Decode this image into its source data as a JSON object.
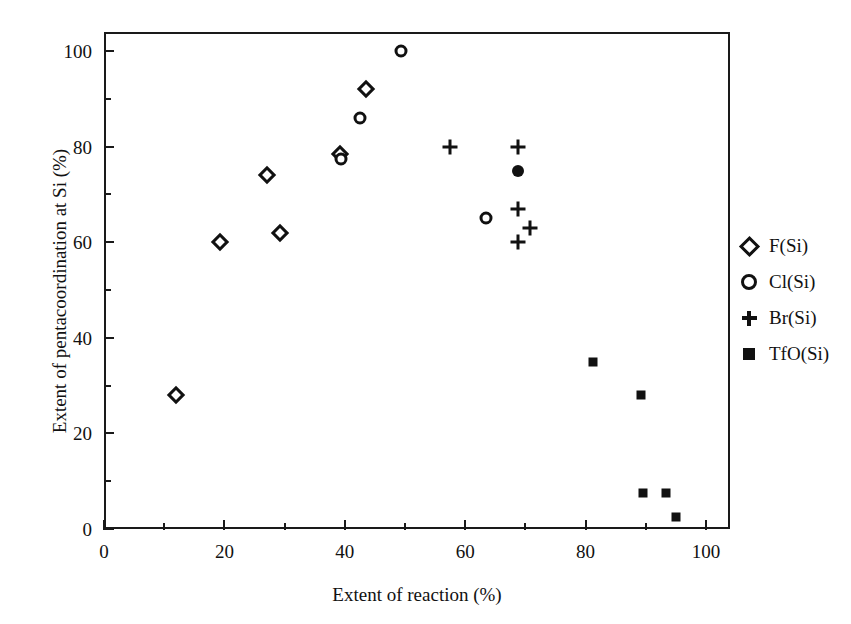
{
  "chart_data": {
    "type": "scatter",
    "title": "",
    "xlabel": "Extent of reaction (%)",
    "ylabel": "Extent of pentacoordination at Si (%)",
    "xlim": [
      0,
      104
    ],
    "ylim": [
      0,
      104
    ],
    "xticks": [
      0,
      20,
      40,
      60,
      80,
      100
    ],
    "xticklabels": [
      "0",
      "20",
      "40",
      "60",
      "80",
      "100"
    ],
    "xminorticks": [
      10,
      30,
      50,
      70,
      90
    ],
    "yticks": [
      0,
      20,
      40,
      60,
      80,
      100
    ],
    "yticklabels": [
      "0",
      "20",
      "40",
      "60",
      "80",
      "100"
    ],
    "yminorticks": [
      10,
      30,
      50,
      70,
      90
    ],
    "grid": false,
    "legend_position": "outside-right",
    "series": [
      {
        "name": "F(Si)",
        "marker": "diamond-open",
        "points": [
          {
            "x": 12.0,
            "y": 28.0
          },
          {
            "x": 19.3,
            "y": 60.0
          },
          {
            "x": 27.0,
            "y": 74.0
          },
          {
            "x": 29.3,
            "y": 62.0
          },
          {
            "x": 39.2,
            "y": 78.5
          },
          {
            "x": 43.5,
            "y": 92.0
          }
        ]
      },
      {
        "name": "Cl(Si)",
        "marker": "circle-open",
        "points": [
          {
            "x": 39.3,
            "y": 77.5
          },
          {
            "x": 42.6,
            "y": 86.0
          },
          {
            "x": 49.4,
            "y": 100.0
          },
          {
            "x": 63.5,
            "y": 65.0
          }
        ]
      },
      {
        "name": "Br(Si)",
        "marker": "plus",
        "points": [
          {
            "x": 57.5,
            "y": 80.0
          },
          {
            "x": 68.8,
            "y": 80.0
          },
          {
            "x": 68.8,
            "y": 67.0
          },
          {
            "x": 70.8,
            "y": 63.0
          },
          {
            "x": 68.8,
            "y": 60.0
          }
        ]
      },
      {
        "name": "TfO(Si)",
        "marker": "square-filled",
        "points": [
          {
            "x": 81.2,
            "y": 35.0
          },
          {
            "x": 89.2,
            "y": 28.0
          },
          {
            "x": 89.5,
            "y": 7.5
          },
          {
            "x": 93.3,
            "y": 7.5
          },
          {
            "x": 95.0,
            "y": 2.5
          }
        ]
      },
      {
        "name": "unlabeled-filled-circle",
        "marker": "circle-filled",
        "points": [
          {
            "x": 68.8,
            "y": 75.0
          }
        ]
      }
    ],
    "legend": [
      {
        "label": "F(Si)",
        "marker": "diamond-open"
      },
      {
        "label": "Cl(Si)",
        "marker": "circle-open"
      },
      {
        "label": "Br(Si)",
        "marker": "plus"
      },
      {
        "label": "TfO(Si)",
        "marker": "square-filled"
      }
    ],
    "colors": {
      "axis": "#1a1a1a",
      "marker": "#111111",
      "background": "#ffffff"
    }
  }
}
